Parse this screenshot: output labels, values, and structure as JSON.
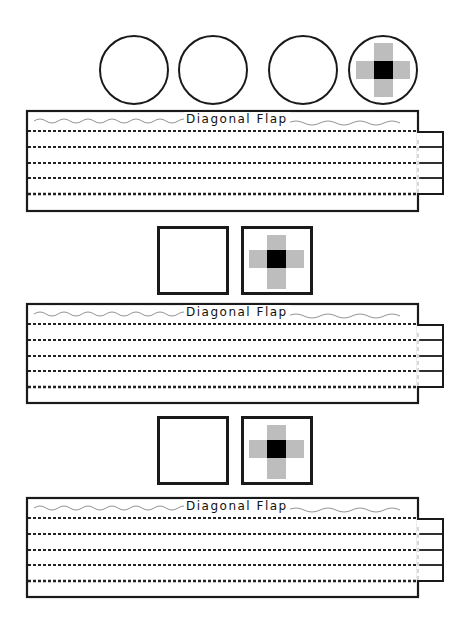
{
  "page": {
    "background": "#ffffff",
    "ink_color": "#1a1a1a",
    "cross_gray": "#bdbdbd",
    "cross_center": "#000000"
  },
  "circles": [
    {
      "id": "circle-1",
      "marked": false
    },
    {
      "id": "circle-2",
      "marked": false
    },
    {
      "id": "circle-3",
      "marked": false
    },
    {
      "id": "circle-4",
      "marked": true,
      "mark_icon": "cross-target-icon"
    }
  ],
  "sections": [
    {
      "squares": [
        {
          "marked": false
        },
        {
          "marked": true,
          "mark_icon": "cross-target-icon"
        }
      ],
      "strip": {
        "label": "Diagonal Flap",
        "fold_lines": 5,
        "tab_segments": 4
      }
    },
    {
      "squares": [
        {
          "marked": false
        },
        {
          "marked": true,
          "mark_icon": "cross-target-icon"
        }
      ],
      "strip": {
        "label": "Diagonal Flap",
        "fold_lines": 5,
        "tab_segments": 4
      }
    }
  ],
  "top_strip": {
    "label": "Diagonal Flap",
    "fold_lines": 5,
    "tab_segments": 4
  }
}
